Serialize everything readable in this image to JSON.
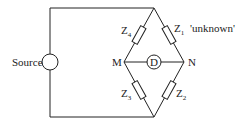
{
  "diagram": {
    "title": "",
    "source_label": "Source",
    "detector_label": "D",
    "node_m": "M",
    "node_n": "N",
    "z4": {
      "main": "Z",
      "sub": "4"
    },
    "z1": {
      "main": "Z",
      "sub": "1",
      "note": "'unknown'"
    },
    "z3": {
      "main": "Z",
      "sub": "3"
    },
    "z2": {
      "main": "Z",
      "sub": "2"
    }
  }
}
